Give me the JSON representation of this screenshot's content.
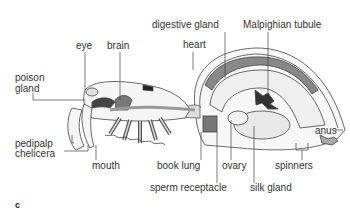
{
  "figure": {
    "panel_label": "c"
  },
  "labels": {
    "eye": "eye",
    "brain": "brain",
    "poison_gland_line1": "poison",
    "poison_gland_line2": "gland",
    "digestive_gland": "digestive gland",
    "malpighian_tubule": "Malpighian tubule",
    "heart": "heart",
    "pedipalp": "pedipalp",
    "chelicera": "chelicera",
    "mouth": "mouth",
    "book_lung": "book lung",
    "sperm_receptacle": "sperm receptacle",
    "ovary": "ovary",
    "silk_gland": "silk gland",
    "spinners": "spinners",
    "anus": "anus"
  },
  "colors": {
    "line": "#444444",
    "organ_dark": "#555555",
    "organ_mid": "#9a9a9a",
    "organ_light": "#dcdcdc",
    "text": "#333333"
  }
}
